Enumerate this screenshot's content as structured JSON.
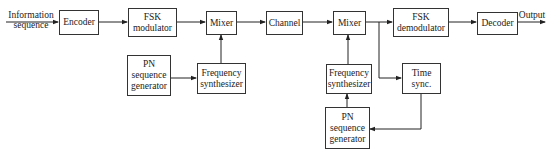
{
  "diagram": {
    "type": "block-diagram",
    "title": "",
    "input_label": [
      "Information",
      "sequence"
    ],
    "output_label": "Output",
    "blocks": {
      "encoder": "Encoder",
      "fsk_mod": [
        "FSK",
        "modulator"
      ],
      "mixer1": "Mixer",
      "channel": "Channel",
      "mixer2": "Mixer",
      "fsk_demod": [
        "FSK",
        "demodulator"
      ],
      "decoder": "Decoder",
      "pn_gen1": [
        "PN",
        "sequence",
        "generator"
      ],
      "freq_synth1": [
        "Frequency",
        "synthesizer"
      ],
      "freq_synth2": [
        "Frequency",
        "synthesizer"
      ],
      "time_sync": [
        "Time",
        "sync."
      ],
      "pn_gen2": [
        "PN",
        "sequence",
        "generator"
      ]
    },
    "connections": [
      [
        "input",
        "encoder"
      ],
      [
        "encoder",
        "fsk_mod"
      ],
      [
        "fsk_mod",
        "mixer1"
      ],
      [
        "mixer1",
        "channel"
      ],
      [
        "channel",
        "mixer2"
      ],
      [
        "mixer2",
        "fsk_demod"
      ],
      [
        "fsk_demod",
        "decoder"
      ],
      [
        "decoder",
        "output"
      ],
      [
        "pn_gen1",
        "freq_synth1"
      ],
      [
        "freq_synth1",
        "mixer1"
      ],
      [
        "mixer2",
        "time_sync"
      ],
      [
        "time_sync",
        "pn_gen2"
      ],
      [
        "pn_gen2",
        "freq_synth2"
      ],
      [
        "freq_synth2",
        "mixer2"
      ]
    ]
  }
}
